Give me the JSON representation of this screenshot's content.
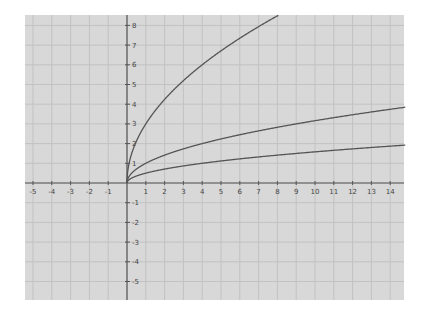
{
  "chart_data": {
    "type": "line",
    "title": "",
    "xlabel": "",
    "ylabel": "",
    "xlim": [
      -5.4,
      14.8
    ],
    "ylim": [
      -6,
      8.6
    ],
    "grid": true,
    "x_ticks": [
      -5,
      -4,
      -3,
      -2,
      -1,
      1,
      2,
      3,
      4,
      5,
      6,
      7,
      8,
      9,
      10,
      11,
      12,
      13,
      14
    ],
    "y_ticks": [
      -5,
      -4,
      -3,
      -2,
      -1,
      1,
      2,
      3,
      4,
      5,
      6,
      7,
      8
    ],
    "series": [
      {
        "name": "y = 3√x",
        "coef": 3,
        "x": [
          0,
          0.25,
          1,
          2,
          3,
          4,
          5,
          6,
          7,
          8,
          8.2
        ],
        "y": [
          0,
          1.5,
          3,
          4.24,
          5.2,
          6,
          6.71,
          7.35,
          7.94,
          8.49,
          8.59
        ]
      },
      {
        "name": "y = √x",
        "coef": 1,
        "x": [
          0,
          1,
          2,
          4,
          6,
          8,
          10,
          12,
          14
        ],
        "y": [
          0,
          1,
          1.41,
          2,
          2.45,
          2.83,
          3.16,
          3.46,
          3.74
        ]
      },
      {
        "name": "y = 0.5√x",
        "coef": 0.5,
        "x": [
          0,
          1,
          2,
          4,
          6,
          8,
          10,
          12,
          14
        ],
        "y": [
          0,
          0.5,
          0.71,
          1,
          1.22,
          1.41,
          1.58,
          1.73,
          1.87
        ]
      }
    ],
    "legend": "none"
  },
  "style": {
    "background": "#d8d8d8",
    "grid_color": "#c2c2c2",
    "axis_color": "#555555",
    "curve_color": "#555555"
  }
}
